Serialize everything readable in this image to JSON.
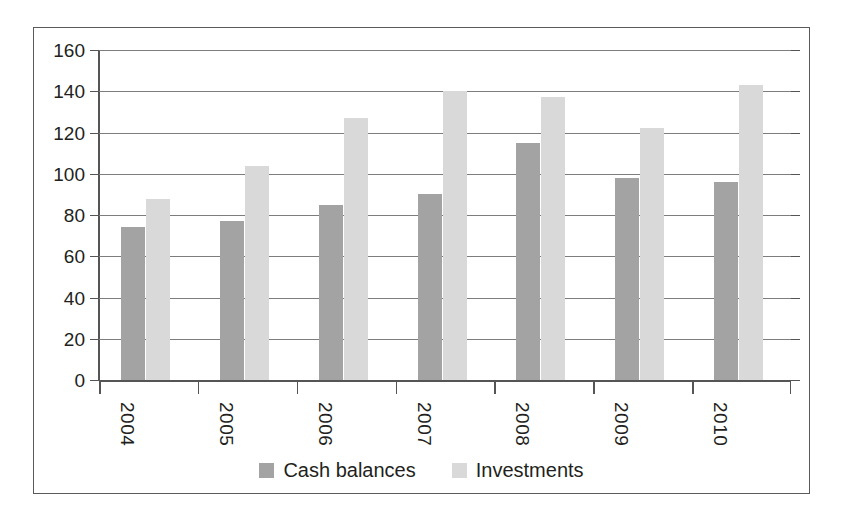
{
  "chart_data": {
    "type": "bar",
    "title": "",
    "xlabel": "",
    "ylabel": "",
    "categories": [
      "2004",
      "2005",
      "2006",
      "2007",
      "2008",
      "2009",
      "2010"
    ],
    "series": [
      {
        "name": "Cash balances",
        "color": "#a3a3a3",
        "values": [
          74,
          77,
          85,
          90,
          115,
          98,
          96
        ]
      },
      {
        "name": "Investments",
        "color": "#d9d9d9",
        "values": [
          88,
          104,
          127,
          140,
          137,
          122,
          143
        ]
      }
    ],
    "ylim": [
      0,
      160
    ],
    "ytick_labels": [
      "0",
      "20",
      "40",
      "60",
      "80",
      "100",
      "120",
      "140",
      "160"
    ],
    "ytick_values": [
      0,
      20,
      40,
      60,
      80,
      100,
      120,
      140,
      160
    ],
    "grid": true,
    "legend_position": "bottom",
    "xtick_label_rotation": 90
  }
}
